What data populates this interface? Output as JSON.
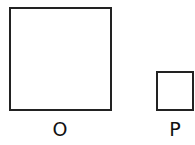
{
  "shapes": [
    {
      "id": "O",
      "label": "O",
      "type": "square",
      "size": "large"
    },
    {
      "id": "P",
      "label": "P",
      "type": "square",
      "size": "small"
    }
  ],
  "colors": {
    "stroke": "#222222",
    "fill": "#ffffff",
    "text": "#111111"
  }
}
